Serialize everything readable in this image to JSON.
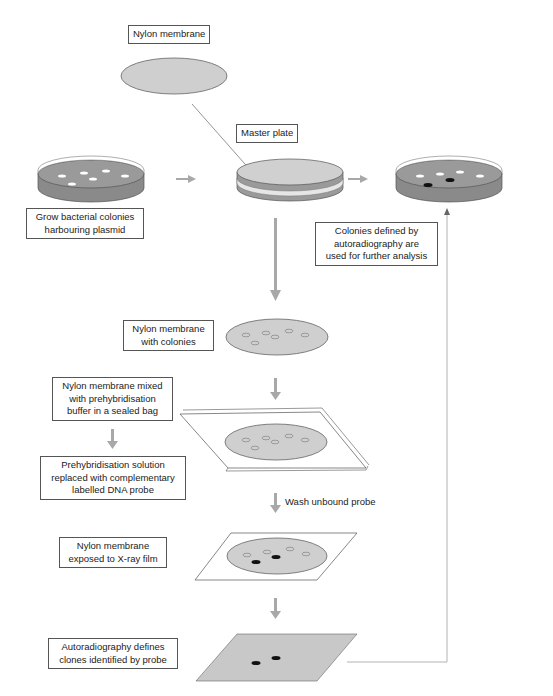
{
  "diagram": {
    "colors": {
      "arrow_grey": "#a8a8a8",
      "plate_agar": "#9a9a9a",
      "membrane": "#cfcfcf",
      "film": "#c8c8c8",
      "spot_positive": "#111111",
      "border": "#555555"
    },
    "labels": {
      "nylon_membrane": "Nylon membrane",
      "master_plate": "Master plate",
      "grow_colonies": [
        "Grow bacterial colonies",
        "harbouring plasmid"
      ],
      "colonies_defined": [
        "Colonies defined by",
        "autoradiography are",
        "used for further analysis"
      ],
      "membrane_with_colonies": [
        "Nylon membrane",
        "with colonies"
      ],
      "membrane_mixed": [
        "Nylon membrane mixed",
        "with prehybridisation",
        "buffer in a sealed bag"
      ],
      "prehyb_replaced": [
        "Prehybridisation solution",
        "replaced with complementary",
        "labelled DNA probe"
      ],
      "wash": "Wash unbound probe",
      "exposed_film": [
        "Nylon membrane",
        "exposed to X-ray film"
      ],
      "autoradiography": [
        "Autoradiography defines",
        "clones identified by probe"
      ]
    }
  }
}
